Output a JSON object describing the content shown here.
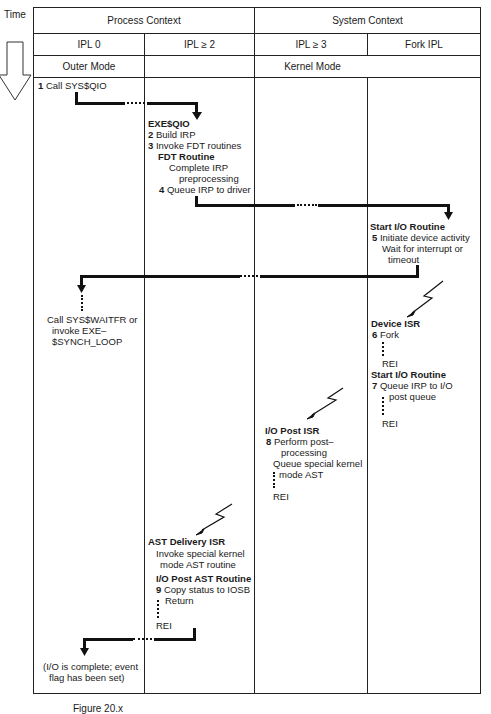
{
  "time_label": "Time",
  "headers": {
    "process_context": "Process Context",
    "system_context": "System Context",
    "ipl0": "IPL 0",
    "ipl_ge2": "IPL ≥ 2",
    "ipl_ge3": "IPL ≥ 3",
    "fork_ipl": "Fork IPL",
    "outer_mode": "Outer Mode",
    "kernel_mode": "Kernel Mode"
  },
  "steps": {
    "s1": {
      "num": "1",
      "text": "Call SYS$QIO"
    },
    "exeqio": {
      "title": "EXE$QIO"
    },
    "s2": {
      "num": "2",
      "text": "Build IRP"
    },
    "s3": {
      "num": "3",
      "text": "Invoke FDT routines"
    },
    "fdt": {
      "title": "FDT Routine",
      "line1": "Complete IRP",
      "line2": "preprocessing"
    },
    "s4": {
      "num": "4",
      "text": "Queue IRP to driver"
    },
    "startio1": {
      "title": "Start I/O Routine"
    },
    "s5": {
      "num": "5",
      "text": "Initiate device activity",
      "line2": "Wait for interrupt or",
      "line3": "timeout"
    },
    "wait": {
      "line1": "Call SYS$WAITFR or",
      "line2": "invoke EXE–",
      "line3": "$SYNCH_LOOP"
    },
    "device_isr": {
      "title": "Device ISR"
    },
    "s6": {
      "num": "6",
      "text": "Fork",
      "rei": "REI"
    },
    "startio2": {
      "title": "Start I/O Routine"
    },
    "s7": {
      "num": "7",
      "text": "Queue IRP to I/O",
      "line2": "post queue",
      "rei": "REI"
    },
    "post_isr": {
      "title": "I/O Post ISR"
    },
    "s8": {
      "num": "8",
      "text": "Perform post–",
      "line2": "processing",
      "line3": "Queue special kernel",
      "line4": "mode AST",
      "rei": "REI"
    },
    "ast_isr": {
      "title": "AST Delivery ISR",
      "line1": "Invoke special kernel",
      "line2": "mode AST routine"
    },
    "post_ast": {
      "title": "I/O Post AST Routine"
    },
    "s9": {
      "num": "9",
      "text": "Copy status to IOSB",
      "line2": "Return",
      "rei": "REI"
    },
    "done": {
      "line1": "(I/O is complete; event",
      "line2": "flag has been set)"
    }
  },
  "caption": "Figure 20.x"
}
